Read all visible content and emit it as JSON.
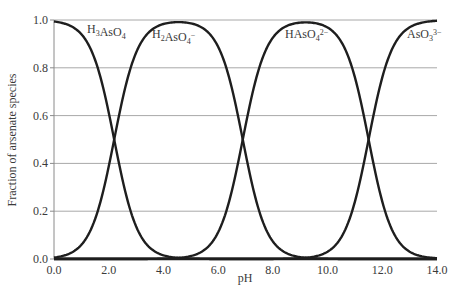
{
  "chart_data": {
    "type": "line",
    "title": "",
    "xlabel": "pH",
    "ylabel": "Fraction of arsenate species",
    "xlim": [
      0.0,
      14.0
    ],
    "ylim": [
      0.0,
      1.0
    ],
    "xticks": [
      "0.0",
      "2.0",
      "4.0",
      "6.0",
      "8.0",
      "10.0",
      "12.0",
      "14.0"
    ],
    "yticks": [
      "0.0",
      "0.2",
      "0.4",
      "0.6",
      "0.8",
      "1.0"
    ],
    "grid": "horizontal",
    "pKa": [
      2.2,
      6.9,
      11.5
    ],
    "series": [
      {
        "name": "H3AsO4",
        "label_main": "H",
        "label_parts": [
          [
            "H",
            ""
          ],
          [
            "3",
            "sub"
          ],
          [
            "AsO",
            ""
          ],
          [
            "4",
            "sub"
          ]
        ],
        "peak_x": 0.0,
        "x": [
          0,
          1,
          1.5,
          2,
          2.2,
          2.5,
          3,
          3.5,
          4,
          5,
          14
        ],
        "values": [
          0.99,
          0.94,
          0.83,
          0.61,
          0.5,
          0.33,
          0.14,
          0.05,
          0.02,
          0.0,
          0.0
        ]
      },
      {
        "name": "H2AsO4−",
        "label_parts": [
          [
            "H",
            ""
          ],
          [
            "2",
            "sub"
          ],
          [
            "AsO",
            ""
          ],
          [
            "4",
            "sub"
          ],
          [
            "−",
            "sup"
          ]
        ],
        "peak_x": 4.55,
        "x": [
          0,
          1,
          2,
          2.2,
          3,
          4,
          4.55,
          5,
          6,
          6.9,
          8,
          9,
          14
        ],
        "values": [
          0.06,
          0.06,
          0.39,
          0.5,
          0.86,
          0.99,
          1.0,
          0.99,
          0.89,
          0.5,
          0.07,
          0.01,
          0.0
        ]
      },
      {
        "name": "HAsO42−",
        "label_parts": [
          [
            "HAsO",
            ""
          ],
          [
            "4",
            "sub"
          ],
          [
            "2−",
            "sup"
          ]
        ],
        "peak_x": 9.2,
        "x": [
          0,
          5,
          6,
          6.9,
          8,
          9.2,
          10,
          11,
          11.5,
          12,
          13,
          14
        ],
        "values": [
          0.0,
          0.01,
          0.11,
          0.5,
          0.93,
          1.0,
          0.97,
          0.76,
          0.5,
          0.24,
          0.03,
          0.0
        ]
      },
      {
        "name": "AsO33−",
        "label_parts": [
          [
            "AsO",
            ""
          ],
          [
            "3",
            "sub"
          ],
          [
            "3−",
            "sup"
          ]
        ],
        "peak_x": 14.0,
        "x": [
          0,
          9,
          10,
          11,
          11.5,
          12,
          13,
          14
        ],
        "values": [
          0.0,
          0.0,
          0.03,
          0.24,
          0.5,
          0.76,
          0.97,
          1.0
        ]
      }
    ],
    "labels": [
      "H3AsO4",
      "H2AsO4−",
      "HAsO42−",
      "AsO33−"
    ]
  }
}
